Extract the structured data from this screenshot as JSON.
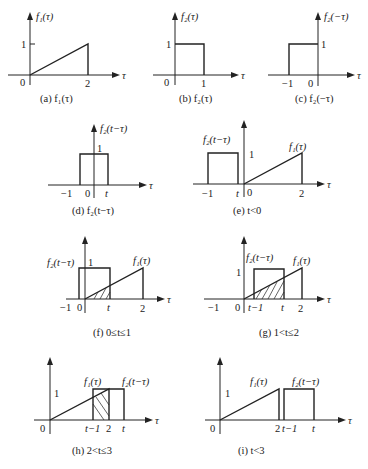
{
  "figure": {
    "axis_var": "τ",
    "panels": [
      {
        "id": "a",
        "caption": "(a) f₁(τ)",
        "ylabel": "f₁(τ)",
        "ticks": [
          "0",
          "2"
        ],
        "ytick": "1"
      },
      {
        "id": "b",
        "caption": "(b) f₂(τ)",
        "ylabel": "f₂(τ)",
        "ticks": [
          "0",
          "1"
        ],
        "ytick": "1"
      },
      {
        "id": "c",
        "caption": "(c) f₂(−τ)",
        "ylabel": "f₂(−τ)",
        "ticks": [
          "−1",
          "0"
        ],
        "ytick": "1"
      },
      {
        "id": "d",
        "caption": "(d) f₂(t−τ)",
        "ylabel": "f₂(t−τ)",
        "ticks": [
          "−1",
          "0",
          "t"
        ],
        "ytick": "1"
      },
      {
        "id": "e",
        "caption": "(e) t<0",
        "labels": [
          "f₂(t−τ)",
          "f₁(τ)"
        ],
        "ticks": [
          "−1",
          "t",
          "0",
          "2"
        ],
        "ytick": "1"
      },
      {
        "id": "f",
        "caption": "(f) 0≤t≤1",
        "labels": [
          "f₂(t−τ)",
          "f₁(τ)"
        ],
        "ticks": [
          "−1",
          "0",
          "t",
          "2"
        ],
        "ytick": "1"
      },
      {
        "id": "g",
        "caption": "(g) 1<t≤2",
        "labels": [
          "f₂(t−τ)",
          "f₁(τ)"
        ],
        "ticks": [
          "−1",
          "0",
          "t−1",
          "t",
          "2"
        ],
        "ytick": "1"
      },
      {
        "id": "h",
        "caption": "(h) 2<t≤3",
        "labels": [
          "f₁(τ)",
          "f₂(t−τ)"
        ],
        "ticks": [
          "0",
          "t−1",
          "2",
          "t"
        ],
        "ytick": "1"
      },
      {
        "id": "i",
        "caption": "(i) t<3",
        "labels": [
          "f₁(τ)",
          "f₂(t−τ)"
        ],
        "ticks": [
          "0",
          "2",
          "t−1",
          "t"
        ],
        "ytick": "1"
      }
    ]
  }
}
